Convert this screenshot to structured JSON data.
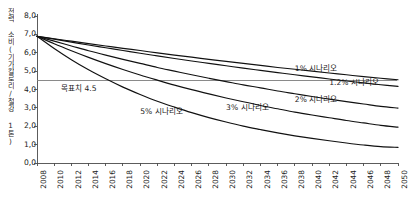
{
  "chart_data": {
    "type": "line",
    "title": "",
    "xlabel": "",
    "ylabel": "전력 소비(기가칼로리/철강 1톤)",
    "xlim": [
      2008,
      2050
    ],
    "ylim": [
      0.0,
      8.0
    ],
    "grid": false,
    "legend_position": "inline-annotations",
    "x_ticks": [
      "2008",
      "2010",
      "2012",
      "2014",
      "2016",
      "2018",
      "2020",
      "2022",
      "2024",
      "2026",
      "2028",
      "2030",
      "2032",
      "2034",
      "2036",
      "2038",
      "2040",
      "2042",
      "2044",
      "2046",
      "2048",
      "2050"
    ],
    "y_ticks": [
      "0,0",
      "1,0",
      "2,0",
      "3,0",
      "4,0",
      "5,0",
      "6,0",
      "7,0",
      "8,0"
    ],
    "y_tick_values": [
      0.0,
      1.0,
      2.0,
      3.0,
      4.0,
      5.0,
      6.0,
      7.0,
      8.0
    ],
    "x": [
      2008,
      2010,
      2012,
      2014,
      2016,
      2018,
      2020,
      2022,
      2024,
      2026,
      2028,
      2030,
      2032,
      2034,
      2036,
      2038,
      2040,
      2042,
      2044,
      2046,
      2048,
      2050
    ],
    "series": [
      {
        "name": "1% 시나리오",
        "rate_percent": 1.0,
        "start_value": 6.9,
        "end_value": 4.53,
        "values": [
          6.9,
          6.76,
          6.63,
          6.5,
          6.37,
          6.24,
          6.12,
          5.99,
          5.87,
          5.76,
          5.64,
          5.53,
          5.42,
          5.31,
          5.2,
          5.1,
          5.0,
          4.9,
          4.8,
          4.7,
          4.61,
          4.53
        ]
      },
      {
        "name": "1.2% 시나리오",
        "rate_percent": 1.2,
        "start_value": 6.9,
        "end_value": 4.17,
        "values": [
          6.9,
          6.74,
          6.58,
          6.42,
          6.27,
          6.12,
          5.97,
          5.83,
          5.69,
          5.55,
          5.42,
          5.29,
          5.16,
          5.04,
          4.92,
          4.8,
          4.69,
          4.57,
          4.46,
          4.36,
          4.26,
          4.17
        ]
      },
      {
        "name": "2% 시나리오",
        "rate_percent": 2.0,
        "start_value": 6.9,
        "end_value": 2.99,
        "values": [
          6.9,
          6.63,
          6.37,
          6.11,
          5.87,
          5.64,
          5.42,
          5.2,
          5.0,
          4.8,
          4.61,
          4.43,
          4.25,
          4.09,
          3.92,
          3.77,
          3.62,
          3.48,
          3.34,
          3.21,
          3.08,
          2.99
        ]
      },
      {
        "name": "3% 시나리오",
        "rate_percent": 3.0,
        "start_value": 6.9,
        "end_value": 1.95,
        "values": [
          6.9,
          6.49,
          6.11,
          5.75,
          5.41,
          5.09,
          4.79,
          4.51,
          4.24,
          3.99,
          3.76,
          3.54,
          3.33,
          3.13,
          2.95,
          2.77,
          2.61,
          2.46,
          2.31,
          2.18,
          2.05,
          1.95
        ]
      },
      {
        "name": "5% 시나리오",
        "rate_percent": 5.0,
        "start_value": 6.9,
        "end_value": 0.85,
        "values": [
          6.9,
          6.23,
          5.62,
          5.07,
          4.58,
          4.13,
          3.73,
          3.36,
          3.04,
          2.74,
          2.47,
          2.23,
          2.01,
          1.82,
          1.64,
          1.48,
          1.34,
          1.21,
          1.09,
          0.98,
          0.89,
          0.85
        ]
      }
    ],
    "reference_line": {
      "label": "목표치 4.5",
      "value": 4.5
    },
    "annotations": [
      {
        "text": "1% 시나리오",
        "x": 2038,
        "y": 5.05
      },
      {
        "text": "1.2% 시나리오",
        "x": 2042,
        "y": 4.3
      },
      {
        "text": "2% 시나리오",
        "x": 2038,
        "y": 3.4
      },
      {
        "text": "3% 시나리오",
        "x": 2030,
        "y": 2.95
      },
      {
        "text": "5% 시나리오",
        "x": 2020,
        "y": 2.7
      }
    ],
    "colors": {
      "line": "#111111",
      "axis": "#4a4a4a",
      "reference_line": "#7d7d7d",
      "text": "#1a1a1a"
    }
  }
}
